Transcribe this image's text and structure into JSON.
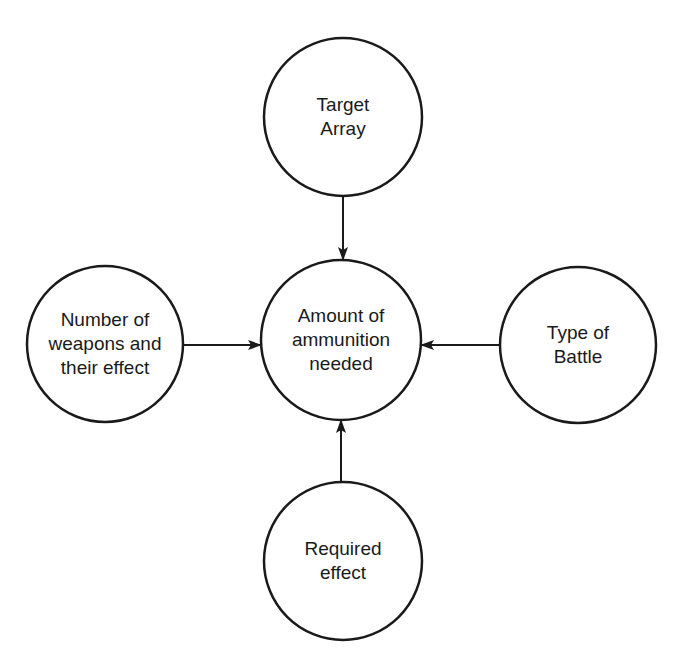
{
  "diagram": {
    "type": "hub-and-spoke influence diagram",
    "colors": {
      "stroke": "#1a1a1a",
      "background": "#ffffff",
      "text": "#1a1a1a"
    },
    "nodes": [
      {
        "id": "target-array",
        "lines": [
          "Target",
          "Array"
        ],
        "cx": 343,
        "cy": 117,
        "r": 79
      },
      {
        "id": "amount-of-ammunition-needed",
        "lines": [
          "Amount of",
          "ammunition",
          "needed"
        ],
        "cx": 341,
        "cy": 340,
        "r": 80
      },
      {
        "id": "number-of-weapons",
        "lines": [
          "Number of",
          "weapons and",
          "their effect"
        ],
        "cx": 105,
        "cy": 344,
        "r": 78
      },
      {
        "id": "type-of-battle",
        "lines": [
          "Type of",
          "Battle"
        ],
        "cx": 578,
        "cy": 345,
        "r": 78
      },
      {
        "id": "required-effect",
        "lines": [
          "Required",
          "effect"
        ],
        "cx": 343,
        "cy": 561,
        "r": 79
      }
    ],
    "edges": [
      {
        "from": "target-array",
        "to": "amount-of-ammunition-needed",
        "x1": 343,
        "y1": 196,
        "x2": 343,
        "y2": 260
      },
      {
        "from": "number-of-weapons",
        "to": "amount-of-ammunition-needed",
        "x1": 183,
        "y1": 345,
        "x2": 261,
        "y2": 345
      },
      {
        "from": "type-of-battle",
        "to": "amount-of-ammunition-needed",
        "x1": 499,
        "y1": 345,
        "x2": 421,
        "y2": 345
      },
      {
        "from": "required-effect",
        "to": "amount-of-ammunition-needed",
        "x1": 341,
        "y1": 482,
        "x2": 341,
        "y2": 420
      }
    ]
  }
}
